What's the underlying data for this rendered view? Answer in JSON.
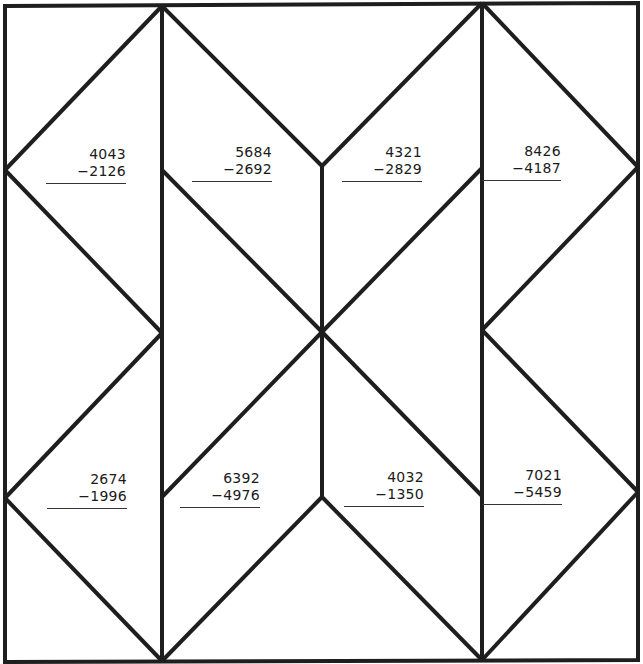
{
  "worksheet": {
    "line_color": "#1e1e1e",
    "background": "#ffffff",
    "problems": [
      {
        "top": "4043",
        "bottom": "−2126"
      },
      {
        "top": "5684",
        "bottom": "−2692"
      },
      {
        "top": "4321",
        "bottom": "−2829"
      },
      {
        "top": "8426",
        "bottom": "−4187"
      },
      {
        "top": "2674",
        "bottom": "−1996"
      },
      {
        "top": "6392",
        "bottom": "−4976"
      },
      {
        "top": "4032",
        "bottom": "−1350"
      },
      {
        "top": "7021",
        "bottom": "−5459"
      }
    ]
  }
}
